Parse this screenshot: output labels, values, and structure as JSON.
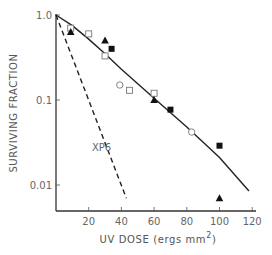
{
  "chart_data": {
    "type": "scatter",
    "title": "",
    "xlabel": "UV DOSE (ergs mm",
    "xlabel_sup": "2",
    "xlabel_close": ")",
    "ylabel": "SURVIVING FRACTION",
    "xlim": [
      0,
      120
    ],
    "ylim": [
      0.005,
      1.0
    ],
    "yscale": "log",
    "x_ticks": [
      20,
      40,
      60,
      80,
      100,
      120
    ],
    "x_tick_labels": [
      "20",
      "40",
      "60",
      "80",
      "100",
      "120"
    ],
    "y_ticks": [
      1.0,
      0.1,
      0.01
    ],
    "y_tick_labels": [
      "1.0",
      "0.1",
      "0.01"
    ],
    "grid": false,
    "series": [
      {
        "name": "open-square",
        "marker": "square-open",
        "points": [
          [
            9,
            0.7
          ],
          [
            20,
            0.6
          ],
          [
            30,
            0.33
          ],
          [
            45,
            0.13
          ],
          [
            60,
            0.12
          ]
        ]
      },
      {
        "name": "filled-triangle",
        "marker": "triangle-filled",
        "points": [
          [
            9,
            0.63
          ],
          [
            30,
            0.5
          ],
          [
            60,
            0.1
          ],
          [
            100,
            0.007
          ]
        ]
      },
      {
        "name": "filled-square",
        "marker": "square-filled",
        "points": [
          [
            34,
            0.4
          ],
          [
            70,
            0.077
          ],
          [
            100,
            0.029
          ]
        ]
      },
      {
        "name": "open-circle",
        "marker": "circle-open",
        "points": [
          [
            39,
            0.15
          ],
          [
            83,
            0.042
          ]
        ]
      }
    ],
    "curves": [
      {
        "name": "normal-fit",
        "style": "solid",
        "points": [
          [
            0,
            1.0
          ],
          [
            10,
            0.75
          ],
          [
            20,
            0.52
          ],
          [
            30,
            0.35
          ],
          [
            40,
            0.23
          ],
          [
            60,
            0.105
          ],
          [
            80,
            0.048
          ],
          [
            100,
            0.021
          ],
          [
            118,
            0.0085
          ]
        ]
      },
      {
        "name": "XP6",
        "style": "dashed",
        "label": "XP6",
        "label_at": [
          22,
          0.025
        ],
        "points": [
          [
            0,
            1.0
          ],
          [
            43,
            0.007
          ]
        ]
      }
    ]
  }
}
